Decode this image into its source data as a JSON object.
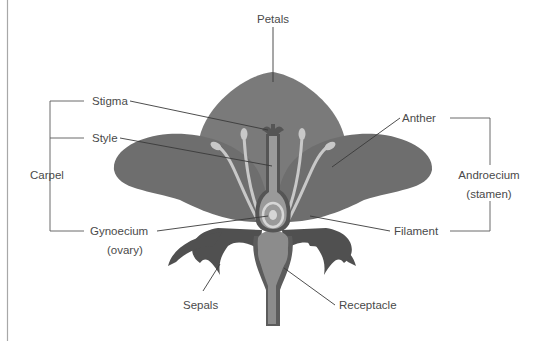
{
  "diagram": {
    "labels": {
      "petals": "Petals",
      "stigma": "Stigma",
      "style": "Style",
      "carpel": "Carpel",
      "gynoecium": "Gynoecium",
      "gynoecium_sub": "(ovary)",
      "sepals": "Sepals",
      "anther": "Anther",
      "androecium": "Androecium",
      "androecium_sub": "(stamen)",
      "filament": "Filament",
      "receptacle": "Receptacle"
    },
    "colors": {
      "petal_back": "#7a7a7a",
      "petal_side": "#6e6e6e",
      "sepal": "#505050",
      "receptacle": "#8c8c8c",
      "receptacle_outline": "#5c5c5c",
      "stamen": "#c8c8c8",
      "pistil": "#9a9a9a",
      "pistil_outline": "#555555",
      "ovary_ring": "#d6d6d6",
      "text": "#4a4a4a",
      "border": "#9a9a9a"
    }
  }
}
